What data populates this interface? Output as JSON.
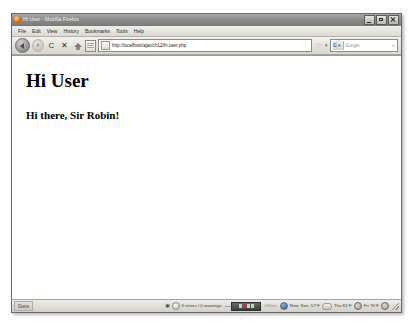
{
  "window": {
    "title": "Hi User - Mozilla Firefox",
    "app_icon": "firefox-icon",
    "controls": {
      "minimize_label": "Minimize",
      "maximize_label": "Maximize",
      "close_label": "Close"
    }
  },
  "menubar": {
    "items": [
      {
        "label": "File"
      },
      {
        "label": "Edit"
      },
      {
        "label": "View"
      },
      {
        "label": "History"
      },
      {
        "label": "Bookmarks"
      },
      {
        "label": "Tools"
      },
      {
        "label": "Help"
      }
    ]
  },
  "toolbar": {
    "back_label": "Back",
    "forward_label": "Forward",
    "reload_glyph": "C",
    "stop_glyph": "✕",
    "home_label": "Home",
    "page_label": "Page",
    "url": {
      "value": "http://localhost/ajax/ch12/hi.user.php",
      "placeholder": "Go to a Website",
      "favicon": "page-favicon",
      "star_glyph": "☆",
      "chevron_glyph": "▾"
    },
    "search": {
      "engine_label": "G",
      "engine_chevron": "▾",
      "placeholder": "Google",
      "go_glyph": "⌕"
    }
  },
  "page": {
    "heading": "Hi User",
    "greeting": "Hi there, Sir Robin!"
  },
  "statusbar": {
    "status_text": "Done",
    "firebug": {
      "bug_glyph": "✱",
      "console_text": "0 errors / 0 warnings"
    },
    "progress": {
      "dash_left": "––",
      "dash_right": "▪"
    },
    "offline_text": "Offline",
    "weather": [
      {
        "label": "Now: San, 57°F",
        "orb": "weather-orb-now"
      },
      {
        "label": "Thu 81°F",
        "orb": "weather-orb-thu"
      },
      {
        "label": "Fri 76°F",
        "orb": "weather-orb-fri"
      }
    ],
    "resize_grip": "resize-grip"
  },
  "colors": {
    "frame": "#d4d0c8",
    "content_bg": "#ffffff",
    "text": "#000000",
    "accent": "#3b6fd1"
  }
}
